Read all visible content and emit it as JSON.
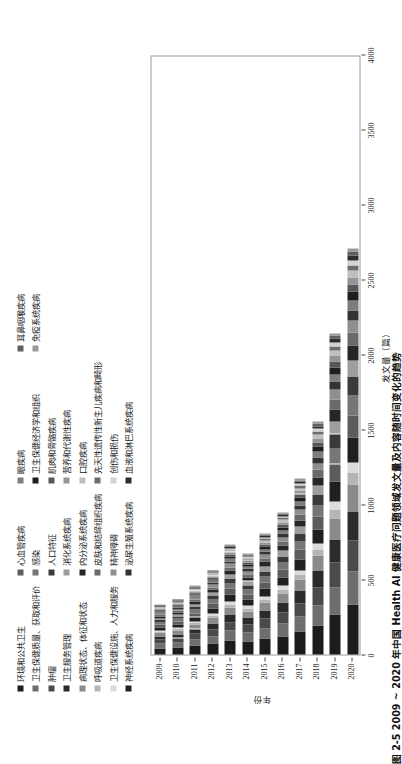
{
  "caption": "图 2-5  2009 ~ 2020 年中国 Health AI 健康医疗问题领域发文量及内容随时间变化的趋势",
  "axes": {
    "y_title": "发文量（篇）",
    "x_title": "年份",
    "count_ticks": [
      "0",
      "500",
      "1000",
      "1500",
      "2000",
      "2500",
      "3000",
      "3500",
      "4000"
    ],
    "count_min": 0,
    "count_max": 4000,
    "years": [
      "2009",
      "2010",
      "2011",
      "2012",
      "2013",
      "2014",
      "2015",
      "2016",
      "2017",
      "2018",
      "2019",
      "2020"
    ]
  },
  "chart_data": {
    "type": "bar",
    "title": "2009 ~ 2020 年中国 Health AI 健康医疗问题领域发文量及内容随时间变化的趋势",
    "orientation": "horizontal-stacked",
    "xlabel": "年份",
    "ylabel": "发文量（篇）",
    "ylim": [
      0,
      4000
    ],
    "grid": false,
    "legend_position": "top",
    "categories": [
      "2009",
      "2010",
      "2011",
      "2012",
      "2013",
      "2014",
      "2015",
      "2016",
      "2017",
      "2018",
      "2019",
      "2020"
    ],
    "series": [
      {
        "name": "环境和公共卫生",
        "color": "#1c1c1c",
        "values": [
          42,
          48,
          62,
          74,
          96,
          88,
          104,
          122,
          150,
          196,
          268,
          330
        ]
      },
      {
        "name": "卫生保健质量、获取和评价",
        "color": "#6e6e6e",
        "values": [
          30,
          33,
          40,
          49,
          63,
          58,
          70,
          82,
          100,
          131,
          180,
          225
        ]
      },
      {
        "name": "肿瘤",
        "color": "#4a4a4a",
        "values": [
          26,
          29,
          36,
          44,
          57,
          52,
          63,
          74,
          91,
          120,
          166,
          208
        ]
      },
      {
        "name": "卫生服务管理",
        "color": "#2b2b2b",
        "values": [
          24,
          26,
          32,
          40,
          52,
          47,
          57,
          67,
          83,
          110,
          152,
          192
        ]
      },
      {
        "name": "病理状态、体征和状态",
        "color": "#8a8a8a",
        "values": [
          22,
          24,
          30,
          37,
          48,
          44,
          53,
          62,
          77,
          102,
          141,
          178
        ]
      },
      {
        "name": "呼吸道疾病",
        "color": "#b5b5b5",
        "values": [
          9,
          10,
          12,
          15,
          20,
          18,
          22,
          26,
          32,
          43,
          60,
          78
        ]
      },
      {
        "name": "卫生保健设施、人力和服务",
        "color": "#dcdcdc",
        "values": [
          8,
          9,
          11,
          14,
          18,
          17,
          20,
          24,
          30,
          40,
          56,
          72
        ]
      },
      {
        "name": "神经系统疾病",
        "color": "#202020",
        "values": [
          20,
          22,
          27,
          34,
          44,
          40,
          48,
          57,
          70,
          93,
          129,
          163
        ]
      },
      {
        "name": "心血管疾病",
        "color": "#5c5c5c",
        "values": [
          18,
          20,
          25,
          31,
          40,
          37,
          44,
          52,
          64,
          85,
          118,
          150
        ]
      },
      {
        "name": "感染",
        "color": "#767676",
        "values": [
          16,
          18,
          22,
          27,
          35,
          32,
          39,
          46,
          57,
          75,
          104,
          133
        ]
      },
      {
        "name": "人口特征",
        "color": "#3a3a3a",
        "values": [
          15,
          16,
          20,
          25,
          32,
          30,
          36,
          42,
          52,
          69,
          96,
          122
        ]
      },
      {
        "name": "消化系统疾病",
        "color": "#9e9e9e",
        "values": [
          13,
          14,
          18,
          22,
          29,
          27,
          32,
          38,
          47,
          62,
          86,
          110
        ]
      },
      {
        "name": "内分泌系统疾病",
        "color": "#262626",
        "values": [
          12,
          13,
          16,
          20,
          26,
          24,
          29,
          34,
          42,
          56,
          78,
          99
        ]
      },
      {
        "name": "皮肤和结缔组织疾病",
        "color": "#6a6a6a",
        "values": [
          10,
          11,
          14,
          17,
          23,
          21,
          25,
          30,
          37,
          49,
          68,
          87
        ]
      },
      {
        "name": "精神障碍",
        "color": "#8f8f8f",
        "values": [
          9,
          10,
          13,
          16,
          21,
          19,
          23,
          27,
          34,
          45,
          62,
          79
        ]
      },
      {
        "name": "泌尿生殖系统疾病",
        "color": "#333333",
        "values": [
          8,
          9,
          11,
          14,
          18,
          17,
          20,
          24,
          30,
          40,
          55,
          70
        ]
      },
      {
        "name": "眼疾病",
        "color": "#7d7d7d",
        "values": [
          7,
          8,
          10,
          13,
          16,
          15,
          18,
          22,
          27,
          36,
          50,
          63
        ]
      },
      {
        "name": "卫生保健经济学和组织",
        "color": "#1e1e1e",
        "values": [
          7,
          7,
          9,
          11,
          15,
          14,
          17,
          20,
          25,
          33,
          45,
          58
        ]
      },
      {
        "name": "肌肉和骨骼疾病",
        "color": "#575757",
        "values": [
          6,
          7,
          8,
          10,
          14,
          13,
          15,
          18,
          22,
          30,
          41,
          52
        ]
      },
      {
        "name": "营养和代谢性疾病",
        "color": "#949494",
        "values": [
          5,
          6,
          7,
          9,
          12,
          11,
          14,
          16,
          20,
          27,
          37,
          47
        ]
      },
      {
        "name": "口腔疾病",
        "color": "#bfbfbf",
        "values": [
          5,
          5,
          7,
          8,
          11,
          10,
          12,
          15,
          18,
          24,
          33,
          42
        ]
      },
      {
        "name": "先天性遗传性新生儿疾病和畸形",
        "color": "#6d6d6d",
        "values": [
          4,
          5,
          6,
          7,
          10,
          9,
          11,
          13,
          16,
          21,
          29,
          37
        ]
      },
      {
        "name": "创伤和损伤",
        "color": "#d2d2d2",
        "values": [
          4,
          4,
          5,
          7,
          9,
          8,
          10,
          12,
          14,
          19,
          26,
          33
        ]
      },
      {
        "name": "血液和淋巴系统疾病",
        "color": "#2e2e2e",
        "values": [
          3,
          4,
          5,
          6,
          8,
          7,
          9,
          10,
          13,
          17,
          24,
          30
        ]
      },
      {
        "name": "耳鼻咽喉疾病",
        "color": "#606060",
        "values": [
          3,
          3,
          4,
          5,
          7,
          6,
          8,
          9,
          11,
          15,
          21,
          26
        ]
      },
      {
        "name": "免疫系统疾病",
        "color": "#9a9a9a",
        "values": [
          2,
          3,
          4,
          5,
          6,
          6,
          7,
          8,
          10,
          13,
          18,
          23
        ]
      }
    ],
    "totals": [
      328,
      364,
      454,
      560,
      730,
      670,
      806,
      950,
      1172,
      1551,
      2143,
      2727
    ]
  }
}
